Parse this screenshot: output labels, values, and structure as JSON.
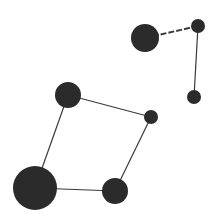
{
  "diagram": {
    "type": "network-graph",
    "width": 220,
    "height": 222,
    "background": "#ffffff",
    "node_color": "#2b2b2b",
    "edge_color": "#3a3a3a",
    "nodes": [
      {
        "id": "n1",
        "x": 145,
        "y": 38,
        "r": 14
      },
      {
        "id": "n2",
        "x": 198,
        "y": 26,
        "r": 7
      },
      {
        "id": "n3",
        "x": 194,
        "y": 97,
        "r": 7
      },
      {
        "id": "n4",
        "x": 68,
        "y": 95,
        "r": 13
      },
      {
        "id": "n5",
        "x": 151,
        "y": 117,
        "r": 7
      },
      {
        "id": "n6",
        "x": 35,
        "y": 188,
        "r": 22
      },
      {
        "id": "n7",
        "x": 115,
        "y": 191,
        "r": 13
      }
    ],
    "edges": [
      {
        "source": "n1",
        "target": "n2",
        "style": "dashed",
        "width": 2
      },
      {
        "source": "n2",
        "target": "n3",
        "style": "solid",
        "width": 1.2
      },
      {
        "source": "n4",
        "target": "n5",
        "style": "solid",
        "width": 1.2
      },
      {
        "source": "n4",
        "target": "n6",
        "style": "solid",
        "width": 1.2
      },
      {
        "source": "n5",
        "target": "n7",
        "style": "solid",
        "width": 1.2
      },
      {
        "source": "n6",
        "target": "n7",
        "style": "solid",
        "width": 1.2
      }
    ]
  }
}
